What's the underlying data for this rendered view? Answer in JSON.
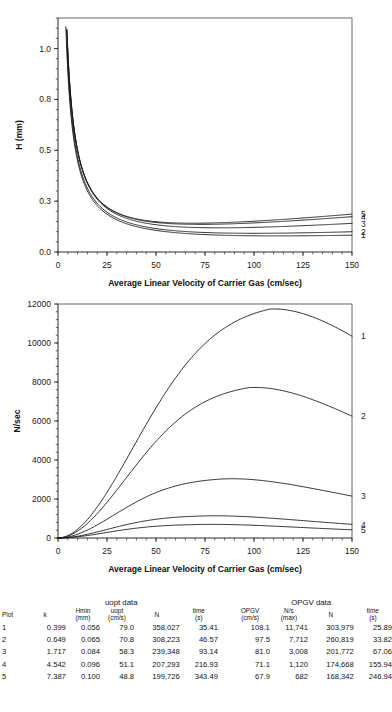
{
  "figure": {
    "xlabel": "Average Linear Velocity of Carrier Gas (cm/sec)",
    "panel_h_ylabel": "H (mm)",
    "panel_n_ylabel": "N/sec",
    "curve_labels": [
      "1",
      "2",
      "3",
      "4",
      "5"
    ]
  },
  "chart_data": [
    {
      "type": "line",
      "id": "plate-height-vs-velocity",
      "title": "",
      "xlabel": "Average Linear Velocity of Carrier Gas (cm/sec)",
      "ylabel": "H (mm)",
      "xlim": [
        0,
        150
      ],
      "ylim": [
        0.0,
        1.15
      ],
      "xticks": [
        0,
        25,
        50,
        75,
        100,
        125,
        150
      ],
      "xticklabels": [
        "0",
        "25",
        "50",
        "75",
        "100",
        "125",
        "150"
      ],
      "yticks": [
        0.0,
        0.25,
        0.5,
        0.75,
        1.0
      ],
      "yticklabels": [
        "0.0",
        "0.3",
        "0.5",
        "0.8",
        "1.0"
      ],
      "minor_xtick_step": 5,
      "minor_ytick_step": 0.05,
      "grid": false,
      "legend": "right-edge-curve-numbers",
      "model": "H = B/u + C*u  (Golay)",
      "series": [
        {
          "name": "1",
          "k": 0.399,
          "Hmin": 0.056,
          "uopt": 79.0,
          "B": 4.424,
          "C": 0.000354,
          "endpoint_y": 0.12
        },
        {
          "name": "2",
          "k": 0.649,
          "Hmin": 0.065,
          "uopt": 70.8,
          "B": 4.602,
          "C": 0.000459,
          "endpoint_y": 0.155
        },
        {
          "name": "3",
          "k": 1.717,
          "Hmin": 0.084,
          "uopt": 58.3,
          "B": 4.899,
          "C": 0.000721,
          "endpoint_y": 0.292
        },
        {
          "name": "4",
          "k": 4.542,
          "Hmin": 0.096,
          "uopt": 51.1,
          "B": 4.906,
          "C": 0.000939,
          "endpoint_y": 0.358
        },
        {
          "name": "5",
          "k": 7.387,
          "Hmin": 0.1,
          "uopt": 48.8,
          "B": 4.88,
          "C": 0.001025,
          "endpoint_y": 0.402
        }
      ]
    },
    {
      "type": "line",
      "id": "plates-per-second-vs-velocity",
      "title": "",
      "xlabel": "Average Linear Velocity of Carrier Gas (cm/sec)",
      "ylabel": "N/sec",
      "xlim": [
        0,
        150
      ],
      "ylim": [
        0,
        12000
      ],
      "xticks": [
        0,
        25,
        50,
        75,
        100,
        125,
        150
      ],
      "xticklabels": [
        "0",
        "25",
        "50",
        "75",
        "100",
        "125",
        "150"
      ],
      "yticks": [
        0,
        2000,
        4000,
        6000,
        8000,
        10000,
        12000
      ],
      "yticklabels": [
        "0",
        "2000",
        "4000",
        "6000",
        "8000",
        "10000",
        "12000"
      ],
      "minor_xtick_step": 5,
      "minor_ytick_step": 400,
      "grid": false,
      "legend": "right-edge-curve-numbers",
      "model": "N/sec = u / ((1+k) * L * H(u))",
      "series": [
        {
          "name": "1",
          "k": 0.399,
          "OPGV": 108.1,
          "Nps_max": 11741,
          "peak_x": 108.1,
          "peak_y": 11741,
          "endpoint_y": 10350
        },
        {
          "name": "2",
          "k": 0.649,
          "OPGV": 97.5,
          "Nps_max": 7712,
          "peak_x": 97.5,
          "peak_y": 7712,
          "endpoint_y": 6250
        },
        {
          "name": "3",
          "k": 1.717,
          "OPGV": 81.0,
          "Nps_max": 3008,
          "peak_x": 81.0,
          "peak_y": 3008,
          "endpoint_y": 2150
        },
        {
          "name": "4",
          "k": 4.542,
          "OPGV": 71.1,
          "Nps_max": 1120,
          "peak_x": 71.1,
          "peak_y": 1120,
          "endpoint_y": 700
        },
        {
          "name": "5",
          "k": 7.387,
          "OPGV": 67.9,
          "Nps_max": 682,
          "peak_x": 67.9,
          "peak_y": 682,
          "endpoint_y": 420
        }
      ]
    }
  ],
  "table": {
    "group_titles": {
      "left": "uopt data",
      "right": "OPGV data"
    },
    "headers": {
      "plot": "Plot",
      "k": "k",
      "hmin": [
        "Hmin",
        "(mm)"
      ],
      "uopt": [
        "uopt",
        "(cm/s)"
      ],
      "n": "N",
      "time": [
        "time",
        "(s)"
      ],
      "opgv": [
        "OPGV",
        "(cm/s)"
      ],
      "nps": [
        "N/s",
        "(max)"
      ],
      "n2": "N",
      "time2": [
        "time",
        "(s)"
      ]
    },
    "rows": [
      {
        "plot": "1",
        "k": "0.399",
        "hmin": "0.056",
        "uopt": "79.0",
        "n": "358,027",
        "time": "35.41",
        "opgv": "108.1",
        "nps": "11,741",
        "n2": "303,979",
        "time2": "25.89"
      },
      {
        "plot": "2",
        "k": "0.649",
        "hmin": "0.065",
        "uopt": "70.8",
        "n": "308,223",
        "time": "46.57",
        "opgv": "97.5",
        "nps": "7,712",
        "n2": "260,819",
        "time2": "33.82"
      },
      {
        "plot": "3",
        "k": "1.717",
        "hmin": "0.084",
        "uopt": "58.3",
        "n": "239,348",
        "time": "93.14",
        "opgv": "81.0",
        "nps": "3,008",
        "n2": "201,772",
        "time2": "67.06"
      },
      {
        "plot": "4",
        "k": "4.542",
        "hmin": "0.096",
        "uopt": "51.1",
        "n": "207,293",
        "time": "216.93",
        "opgv": "71.1",
        "nps": "1,120",
        "n2": "174,668",
        "time2": "155.94"
      },
      {
        "plot": "5",
        "k": "7.387",
        "hmin": "0.100",
        "uopt": "48.8",
        "n": "199,726",
        "time": "343.49",
        "opgv": "67.9",
        "nps": "682",
        "n2": "168,342",
        "time2": "246.94"
      }
    ]
  }
}
